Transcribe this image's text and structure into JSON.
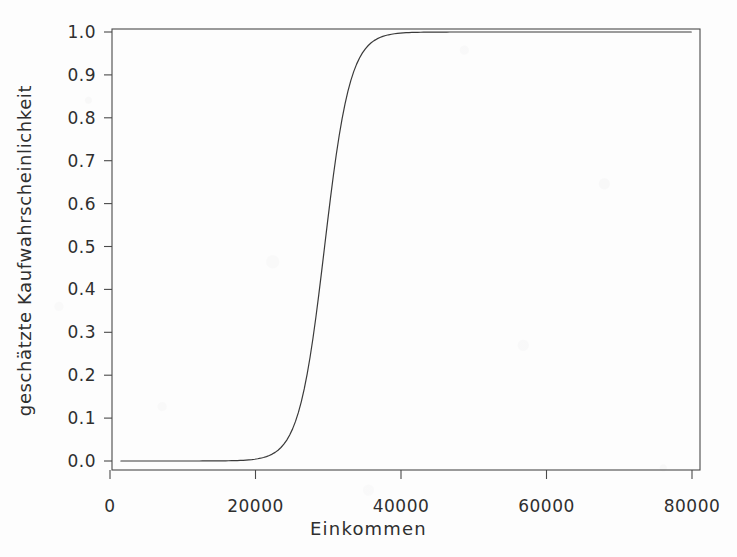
{
  "figure": {
    "background_color": "#fdfdfd",
    "ink_color": "#3a3a3a",
    "appearance": "scanned-photocopy"
  },
  "chart_data": {
    "type": "line",
    "title": "",
    "subtitle": "",
    "xlabel": "Einkommen",
    "ylabel": "geschätzte Kaufwahrscheinlichkeit",
    "xlim": [
      0,
      82000
    ],
    "ylim": [
      -0.015,
      1.03
    ],
    "xticks": [
      0,
      20000,
      40000,
      60000,
      80000
    ],
    "xticklabels": [
      "0",
      "20000",
      "40000",
      "60000",
      "80000"
    ],
    "yticks": [
      0.0,
      0.1,
      0.2,
      0.3,
      0.4,
      0.5,
      0.6,
      0.7,
      0.8,
      0.9,
      1.0
    ],
    "yticklabels": [
      "0.0",
      "0.1",
      "0.2",
      "0.3",
      "0.4",
      "0.5",
      "0.6",
      "0.7",
      "0.8",
      "0.9",
      "1.0"
    ],
    "grid": false,
    "legend": false,
    "legend_position": "none",
    "line_color": "#3a3a3a",
    "line_width": 1.2,
    "model": "logistic",
    "midpoint_x": 29500,
    "series": [
      {
        "name": "geschätzte Kaufwahrscheinlichkeit",
        "x": [
          0,
          2000,
          4000,
          6000,
          8000,
          10000,
          12000,
          14000,
          16000,
          18000,
          20000,
          22000,
          24000,
          26000,
          28000,
          30000,
          32000,
          34000,
          36000,
          38000,
          40000,
          42000,
          44000,
          46000,
          48000,
          50000,
          52000,
          54000,
          56000,
          58000,
          60000,
          64000,
          68000,
          72000,
          76000,
          80000
        ],
        "values": [
          0.004,
          0.005,
          0.007,
          0.01,
          0.014,
          0.02,
          0.028,
          0.04,
          0.056,
          0.079,
          0.11,
          0.151,
          0.204,
          0.27,
          0.347,
          0.432,
          0.52,
          0.605,
          0.683,
          0.751,
          0.807,
          0.852,
          0.888,
          0.915,
          0.936,
          0.952,
          0.964,
          0.973,
          0.98,
          0.985,
          0.989,
          0.993,
          0.996,
          0.997,
          0.998,
          0.99
        ]
      }
    ],
    "annotations": []
  },
  "axes": {
    "box_frame": true,
    "tick_direction": "out",
    "x_title": "Einkommen",
    "y_title": "geschätzte Kaufwahrscheinlichkeit"
  }
}
